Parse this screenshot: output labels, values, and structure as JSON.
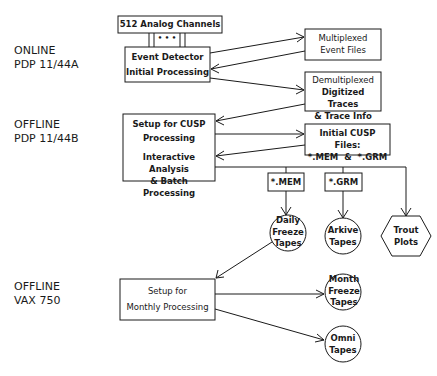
{
  "tiers": [
    {
      "line1": "ONLINE",
      "line2": "PDP 11/44A"
    },
    {
      "line1": "OFFLINE",
      "line2": "PDP 11/44B"
    },
    {
      "line1": "OFFLINE",
      "line2": "VAX 750"
    }
  ],
  "nodes": {
    "analog_channels": {
      "label": "512 Analog Channels",
      "dots": "• • •"
    },
    "event_detector": {
      "line1": "Event Detector",
      "line2": "Initial Processing"
    },
    "multiplexed_files": {
      "line1": "Multiplexed",
      "line2": "Event Files"
    },
    "demultiplexed": {
      "line1": "Demultiplexed",
      "line2": "Digitized Traces",
      "line3": "& Trace Info"
    },
    "cusp_setup": {
      "line1": "Setup for CUSP",
      "line2": "Processing",
      "line3": "Interactive Analysis",
      "line4": "& Batch Processing"
    },
    "initial_cusp_files": {
      "line1": "Initial CUSP Files:",
      "line2": "*.MEM  &  *.GRM"
    },
    "mem_file": {
      "label": "*.MEM"
    },
    "grm_file": {
      "label": "*.GRM"
    },
    "daily_freeze": {
      "line1": "Daily",
      "line2": "Freeze",
      "line3": "Tapes"
    },
    "arkive": {
      "line1": "Arkive",
      "line2": "Tapes"
    },
    "trout": {
      "line1": "Trout",
      "line2": "Plots"
    },
    "monthly_setup": {
      "line1": "Setup for",
      "line2": "Monthly Processing"
    },
    "month_freeze": {
      "line1": "Month",
      "line2": "Freeze",
      "line3": "Tapes"
    },
    "omni": {
      "line1": "Omni",
      "line2": "Tapes"
    }
  }
}
